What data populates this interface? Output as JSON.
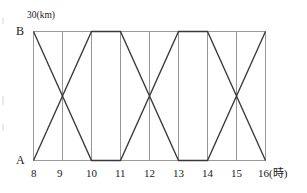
{
  "chart_data": {
    "type": "line",
    "title": "",
    "xlabel": "(時)",
    "ylabel": "(km)",
    "xlim": [
      8,
      16
    ],
    "ylim": [
      0,
      30
    ],
    "grid": true,
    "grid_axis": "x",
    "legend": "none",
    "x_ticks": [
      8,
      9,
      10,
      11,
      12,
      13,
      14,
      15,
      16
    ],
    "x_tick_labels": [
      "8",
      "9",
      "10",
      "11",
      "12",
      "13",
      "14",
      "15",
      "16"
    ],
    "y_ticks": [
      0,
      30
    ],
    "y_tick_labels": [
      "A",
      "B"
    ],
    "y_top_annotation": "30(km)",
    "x_end_annotation": "16(時)",
    "axis_origin_label": "A",
    "axis_top_label": "B",
    "series": [
      {
        "name": "bus-from-B",
        "points": [
          {
            "x": 8,
            "y": 30
          },
          {
            "x": 10,
            "y": 0
          },
          {
            "x": 11,
            "y": 0
          },
          {
            "x": 13,
            "y": 30
          },
          {
            "x": 14,
            "y": 30
          },
          {
            "x": 16,
            "y": 0
          }
        ]
      },
      {
        "name": "bus-from-A",
        "points": [
          {
            "x": 8,
            "y": 0
          },
          {
            "x": 10,
            "y": 30
          },
          {
            "x": 11,
            "y": 30
          },
          {
            "x": 13,
            "y": 0
          },
          {
            "x": 14,
            "y": 0
          },
          {
            "x": 16,
            "y": 30
          }
        ]
      }
    ]
  },
  "labels": {
    "point_a": "A",
    "point_b": "B",
    "top_unit": "30(km)",
    "x_axis_end": "16(時)",
    "ticks": [
      "8",
      "9",
      "10",
      "11",
      "12",
      "13",
      "14",
      "15",
      "16"
    ]
  },
  "colors": {
    "line": "#3a3a3a",
    "grid": "#8a8a8a",
    "frame": "#9a9a9a",
    "text": "#1a1a1a",
    "background": "#ffffff"
  }
}
